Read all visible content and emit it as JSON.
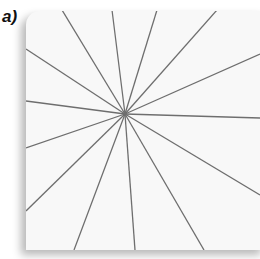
{
  "figure": {
    "label": "a)",
    "card_color": "#f8f8f8",
    "line_color": "#6e6e6e",
    "center": {
      "x": 125,
      "y": 114
    },
    "ray_endpoints": [
      {
        "x": 62,
        "y": 10
      },
      {
        "x": 112,
        "y": 10
      },
      {
        "x": 157,
        "y": 10
      },
      {
        "x": 217,
        "y": 10
      },
      {
        "x": 260,
        "y": 54
      },
      {
        "x": 260,
        "y": 118
      },
      {
        "x": 260,
        "y": 195
      },
      {
        "x": 204,
        "y": 250
      },
      {
        "x": 135,
        "y": 250
      },
      {
        "x": 74,
        "y": 250
      },
      {
        "x": 26,
        "y": 211
      },
      {
        "x": 26,
        "y": 148
      },
      {
        "x": 26,
        "y": 101
      },
      {
        "x": 26,
        "y": 49
      }
    ]
  }
}
